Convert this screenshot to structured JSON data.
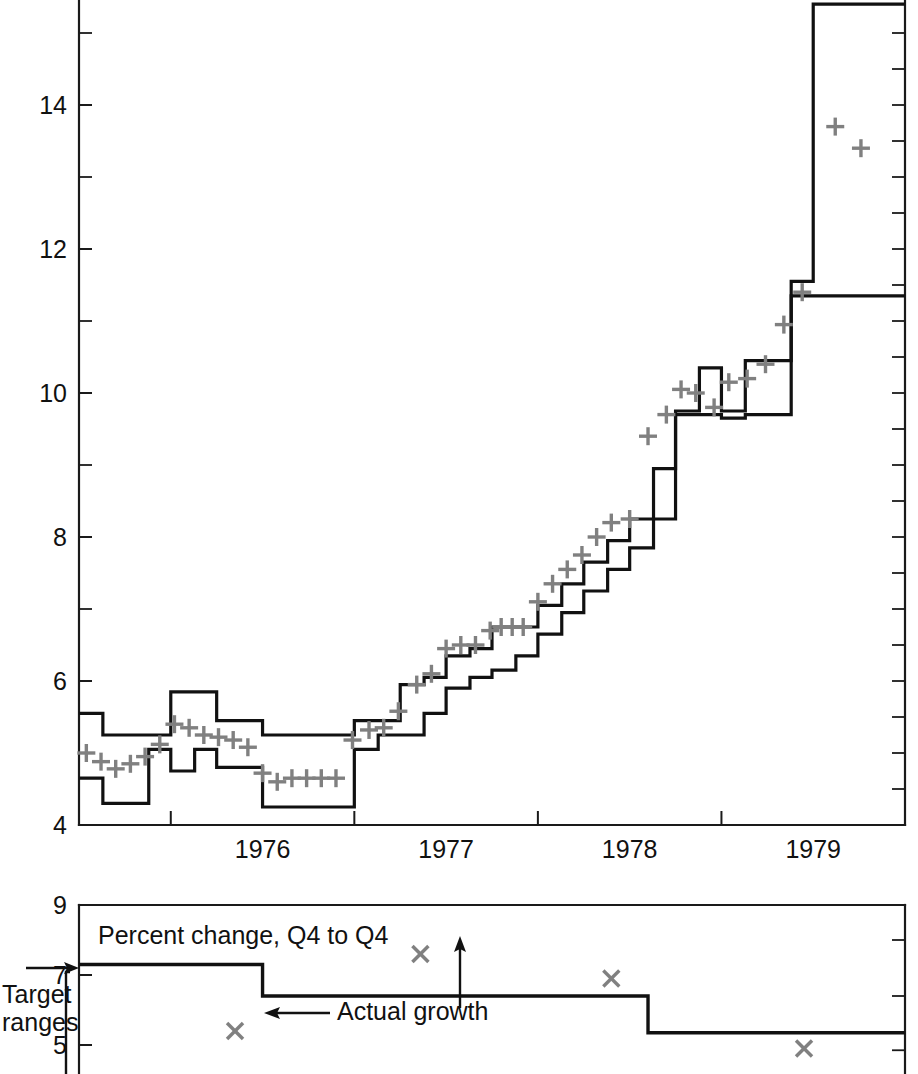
{
  "chart_data": [
    {
      "id": "main-panel",
      "type": "line",
      "title": "",
      "subtitle": "",
      "xlabel": "",
      "ylabel": "",
      "xlim": [
        1975.5,
        1980.0
      ],
      "ylim": [
        4,
        15.6
      ],
      "y_ticks_major": [
        4,
        6,
        8,
        10,
        12,
        14
      ],
      "y_ticks_minor": [
        5,
        7,
        9,
        11,
        13,
        15
      ],
      "x_tick_values": [
        1976.0,
        1977.0,
        1978.0,
        1979.0
      ],
      "x_tick_labels": [
        "1976",
        "1977",
        "1978",
        "1979"
      ],
      "grid": false,
      "legend": "none",
      "series": [
        {
          "name": "Target range upper bound",
          "style": "step",
          "color": "#111111",
          "x": [
            1975.5,
            1975.63,
            1975.75,
            1975.88,
            1976.0,
            1976.13,
            1976.25,
            1976.38,
            1976.5,
            1976.63,
            1976.75,
            1976.88,
            1977.0,
            1977.13,
            1977.25,
            1977.38,
            1977.5,
            1977.63,
            1977.75,
            1977.88,
            1978.0,
            1978.13,
            1978.25,
            1978.38,
            1978.5,
            1978.63,
            1978.75,
            1978.88,
            1979.0,
            1979.13,
            1979.25,
            1979.38,
            1979.5,
            1980.0
          ],
          "values": [
            5.55,
            5.25,
            5.25,
            5.25,
            5.85,
            5.85,
            5.45,
            5.45,
            5.25,
            5.25,
            5.25,
            5.25,
            5.45,
            5.45,
            5.95,
            6.05,
            6.35,
            6.45,
            6.75,
            6.75,
            7.05,
            7.35,
            7.65,
            7.95,
            8.25,
            8.95,
            9.75,
            10.35,
            9.75,
            10.45,
            10.45,
            11.55,
            15.4,
            15.4
          ]
        },
        {
          "name": "Target range lower bound",
          "style": "step",
          "color": "#111111",
          "x": [
            1975.5,
            1975.63,
            1975.75,
            1975.88,
            1976.0,
            1976.13,
            1976.25,
            1976.38,
            1976.5,
            1976.63,
            1976.75,
            1976.88,
            1977.0,
            1977.13,
            1977.25,
            1977.38,
            1977.5,
            1977.63,
            1977.75,
            1977.88,
            1978.0,
            1978.13,
            1978.25,
            1978.38,
            1978.5,
            1978.63,
            1978.75,
            1978.88,
            1979.0,
            1979.13,
            1979.25,
            1979.38,
            1979.5,
            1980.0
          ],
          "values": [
            4.65,
            4.3,
            4.3,
            5.05,
            4.75,
            5.05,
            4.8,
            4.8,
            4.25,
            4.25,
            4.25,
            4.25,
            5.05,
            5.25,
            5.25,
            5.55,
            5.9,
            6.05,
            6.15,
            6.35,
            6.65,
            6.95,
            7.25,
            7.55,
            7.85,
            8.25,
            9.7,
            9.7,
            9.65,
            9.7,
            9.7,
            11.35,
            11.35,
            11.35
          ]
        },
        {
          "name": "Actual money growth",
          "style": "markers",
          "marker": "plus",
          "color": "#808080",
          "points": [
            [
              1975.54,
              5.0
            ],
            [
              1975.62,
              4.88
            ],
            [
              1975.7,
              4.78
            ],
            [
              1975.78,
              4.85
            ],
            [
              1975.86,
              4.95
            ],
            [
              1975.94,
              5.12
            ],
            [
              1976.02,
              5.4
            ],
            [
              1976.1,
              5.35
            ],
            [
              1976.18,
              5.25
            ],
            [
              1976.26,
              5.22
            ],
            [
              1976.34,
              5.18
            ],
            [
              1976.42,
              5.08
            ],
            [
              1976.5,
              4.72
            ],
            [
              1976.58,
              4.6
            ],
            [
              1976.66,
              4.65
            ],
            [
              1976.74,
              4.65
            ],
            [
              1976.82,
              4.65
            ],
            [
              1976.9,
              4.65
            ],
            [
              1976.99,
              5.18
            ],
            [
              1977.08,
              5.32
            ],
            [
              1977.16,
              5.35
            ],
            [
              1977.24,
              5.58
            ],
            [
              1977.34,
              5.95
            ],
            [
              1977.42,
              6.1
            ],
            [
              1977.5,
              6.45
            ],
            [
              1977.58,
              6.5
            ],
            [
              1977.66,
              6.5
            ],
            [
              1977.74,
              6.7
            ],
            [
              1977.8,
              6.75
            ],
            [
              1977.86,
              6.75
            ],
            [
              1977.92,
              6.75
            ],
            [
              1978.0,
              7.1
            ],
            [
              1978.08,
              7.35
            ],
            [
              1978.16,
              7.55
            ],
            [
              1978.24,
              7.75
            ],
            [
              1978.32,
              8.0
            ],
            [
              1978.4,
              8.2
            ],
            [
              1978.5,
              8.25
            ],
            [
              1978.6,
              9.4
            ],
            [
              1978.7,
              9.7
            ],
            [
              1978.78,
              10.05
            ],
            [
              1978.86,
              10.0
            ],
            [
              1978.96,
              9.8
            ],
            [
              1979.04,
              10.15
            ],
            [
              1979.14,
              10.2
            ],
            [
              1979.24,
              10.4
            ],
            [
              1979.34,
              10.95
            ],
            [
              1979.44,
              11.4
            ],
            [
              1979.62,
              13.7
            ],
            [
              1979.76,
              13.4
            ]
          ]
        }
      ]
    },
    {
      "id": "bottom-panel",
      "type": "line",
      "title": "Percent change, Q4 to Q4",
      "xlabel": "",
      "ylabel": "",
      "ylim": [
        4.2,
        9.0
      ],
      "y_ticks_major": [
        5,
        7,
        9
      ],
      "xlim": [
        1975.5,
        1980.0
      ],
      "grid": false,
      "series": [
        {
          "name": "Target range",
          "style": "step",
          "color": "#111111",
          "x": [
            1975.5,
            1976.5,
            1976.5,
            1978.6,
            1978.6,
            1980.0
          ],
          "values": [
            7.3,
            7.3,
            6.4,
            6.4,
            5.35,
            5.35
          ]
        },
        {
          "name": "Actual growth",
          "style": "markers",
          "marker": "x",
          "color": "#808080",
          "points": [
            [
              1976.35,
              5.4
            ],
            [
              1977.36,
              7.6
            ],
            [
              1978.4,
              6.9
            ],
            [
              1979.45,
              4.9
            ]
          ]
        }
      ],
      "annotations": [
        {
          "name": "target-ranges-label",
          "text": "Target ranges"
        },
        {
          "name": "actual-growth-label",
          "text": "Actual growth"
        }
      ]
    }
  ],
  "main_panel": {
    "name": "money-growth-target-ranges-chart",
    "y_tick_labels": [
      {
        "value": 14,
        "label": "14"
      },
      {
        "value": 12,
        "label": "12"
      },
      {
        "value": 10,
        "label": "10"
      },
      {
        "value": 8,
        "label": "8"
      },
      {
        "value": 6,
        "label": "6"
      },
      {
        "value": 4,
        "label": "4"
      }
    ],
    "x_tick_labels": [
      {
        "value": 1976.5,
        "label": "1976"
      },
      {
        "value": 1977.5,
        "label": "1977"
      },
      {
        "value": 1978.5,
        "label": "1978"
      },
      {
        "value": 1979.5,
        "label": "1979"
      }
    ]
  },
  "bottom_panel": {
    "name": "q4-to-q4-percent-change-panel",
    "note": "Percent change, Q4 to Q4",
    "target_ranges_label_line1": "Target",
    "target_ranges_label_line2": "ranges",
    "actual_growth_label": "Actual growth",
    "y_tick_labels": [
      {
        "value": 9,
        "label": "9"
      },
      {
        "value": 7,
        "label": "7"
      },
      {
        "value": 5,
        "label": "5"
      }
    ]
  },
  "colors": {
    "line": "#111111",
    "marker": "#808080",
    "background": "#ffffff",
    "text": "#111111"
  }
}
